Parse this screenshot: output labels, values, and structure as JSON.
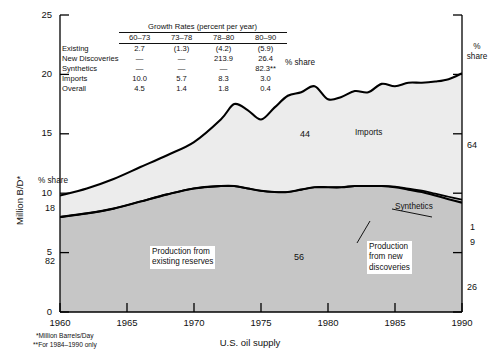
{
  "chart_data": {
    "type": "area",
    "title": "",
    "caption": "U.S. oil supply",
    "xlabel": "",
    "ylabel": "Million B/D*",
    "xlim": [
      1960,
      1990
    ],
    "ylim": [
      0,
      25
    ],
    "grid": false,
    "legend_position": "in-plot annotations",
    "xticks": [
      "1960",
      "1965",
      "1970",
      "1975",
      "1980",
      "1985",
      "1990"
    ],
    "yticks": [
      "0",
      "5",
      "10",
      "15",
      "20",
      "25"
    ],
    "x": [
      1960,
      1962,
      1964,
      1966,
      1968,
      1970,
      1972,
      1973,
      1974,
      1975,
      1976,
      1977,
      1978,
      1979,
      1980,
      1981,
      1982,
      1983,
      1984,
      1985,
      1986,
      1987,
      1988,
      1989,
      1990
    ],
    "series": [
      {
        "name": "Production from existing reserves",
        "values": [
          8.0,
          8.3,
          8.7,
          9.3,
          9.9,
          10.4,
          10.6,
          10.6,
          10.4,
          10.2,
          10.1,
          10.1,
          10.3,
          10.5,
          10.4,
          10.2,
          10.0,
          9.7,
          9.4,
          9.0,
          8.6,
          8.2,
          7.8,
          7.4,
          7.0
        ],
        "fill_color": "#c6c6c6",
        "share_1960": 82,
        "share_1990": 26
      },
      {
        "name": "Production from new discoveries",
        "values": [
          0,
          0,
          0,
          0,
          0,
          0,
          0,
          0,
          0,
          0,
          0,
          0,
          0,
          0,
          0.1,
          0.3,
          0.6,
          0.9,
          1.2,
          1.5,
          1.7,
          1.9,
          2.0,
          2.1,
          2.2
        ],
        "fill_color": "#c6c6c6",
        "share_1990": 9
      },
      {
        "name": "Synthetics",
        "values": [
          0,
          0,
          0,
          0,
          0,
          0,
          0,
          0,
          0,
          0,
          0,
          0,
          0,
          0,
          0,
          0,
          0,
          0,
          0.02,
          0.05,
          0.08,
          0.12,
          0.16,
          0.2,
          0.25
        ],
        "fill_color": "#d8d8d8",
        "share_1990": 1
      },
      {
        "name": "Imports",
        "values": [
          1.8,
          2.1,
          2.5,
          2.9,
          3.3,
          3.9,
          5.6,
          6.9,
          6.6,
          6.0,
          7.1,
          8.1,
          8.2,
          8.5,
          7.4,
          7.6,
          8.0,
          7.9,
          8.6,
          8.4,
          8.9,
          9.0,
          9.2,
          9.6,
          10.6
        ],
        "fill_color": "#ececec",
        "share_1960": 18,
        "share_1990": 64
      }
    ],
    "total": [
      9.8,
      10.4,
      11.2,
      12.2,
      13.2,
      14.3,
      16.2,
      17.5,
      17.0,
      16.2,
      17.2,
      18.2,
      18.5,
      19.0,
      17.9,
      18.1,
      18.6,
      18.5,
      19.2,
      19.0,
      19.3,
      19.3,
      19.4,
      19.6,
      20.1
    ]
  },
  "axes": {
    "ylabel": "Million B/D*",
    "yticks": [
      "25",
      "20",
      "15",
      "10",
      "5",
      "0"
    ],
    "xticks": [
      "1960",
      "1965",
      "1970",
      "1975",
      "1980",
      "1985",
      "1990"
    ]
  },
  "growth_table": {
    "title": "Growth Rates (percent per year)",
    "columns": [
      "60–73",
      "73–78",
      "78–80",
      "80–90"
    ],
    "rows": [
      {
        "label": "Existing",
        "values": [
          "2.7",
          "(1.3)",
          "(4.2)",
          "(5.9)"
        ]
      },
      {
        "label": "New Discoveries",
        "values": [
          "—",
          "—",
          "213.9",
          "26.4"
        ]
      },
      {
        "label": "Synthetics",
        "values": [
          "—",
          "—",
          "—",
          "82.3**"
        ]
      },
      {
        "label": "Imports",
        "values": [
          "10.0",
          "5.7",
          "8.3",
          "3.0"
        ]
      },
      {
        "label": "Overall",
        "values": [
          "4.5",
          "1.4",
          "1.8",
          "0.4"
        ],
        "indent": true
      }
    ]
  },
  "annotations": {
    "share_left": "%\nshare",
    "share_top": "%\nshare",
    "share_right": "%\nshare",
    "left_imports_pct": "18",
    "left_production_pct": "82",
    "right_imports_pct": "64",
    "right_synthetics_pct": "1",
    "right_newdisc_pct": "9",
    "right_existing_pct": "26",
    "mid_imports_pct": "44",
    "mid_production_pct": "56",
    "imports_label": "Imports",
    "existing_label": "Production from\nexisting reserves",
    "new_discoveries_label": "Production\nfrom new\ndiscoveries",
    "synthetics_label": "Synthetics"
  },
  "footnotes": {
    "line1": "*Million Barrels/Day",
    "line2": "**For 1984–1990 only"
  },
  "caption": "U.S. oil supply",
  "colors": {
    "imports_fill": "#ececec",
    "synthetics_fill": "#d8d8d8",
    "production_fill": "#c6c6c6",
    "line": "#000000",
    "axis": "#000000"
  }
}
